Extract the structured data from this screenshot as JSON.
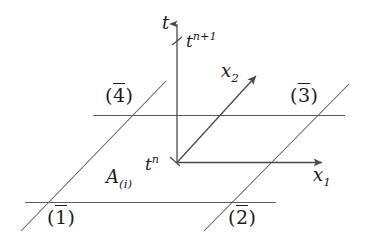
{
  "figure": {
    "background_color": "#ffffff",
    "line_color": "#555555",
    "text_color": "#1d1d1d",
    "axes": {
      "t_axis_label": "t",
      "x1_axis_label": "x",
      "x1_axis_sub": "1",
      "x2_axis_label": "x",
      "x2_axis_sub": "2"
    },
    "time_levels": {
      "lower_base": "t",
      "lower_sup": "n",
      "upper_base": "t",
      "upper_sup": "n+1"
    },
    "area_label": {
      "base": "A",
      "sub": "(i)"
    },
    "boundary_tags": [
      {
        "name": "face-1",
        "open": "(",
        "numeral": "1",
        "close": ")"
      },
      {
        "name": "face-2",
        "open": "(",
        "numeral": "2",
        "close": ")"
      },
      {
        "name": "face-3",
        "open": "(",
        "numeral": "3",
        "close": ")"
      },
      {
        "name": "face-4",
        "open": "(",
        "numeral": "4",
        "close": ")"
      }
    ]
  }
}
